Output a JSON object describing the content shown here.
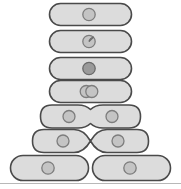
{
  "figure": {
    "background_color": "#ffffff",
    "cell_fill": "#dcdcdc",
    "cell_stroke": "#4a4a4a",
    "nucleoid_fill": "#c4c4c4",
    "nucleoid_stroke": "#7d7d7d",
    "nucleoid_dark_fill": "#9a9a9a",
    "divider_color": "#b8b8b8",
    "stage_count": 7
  },
  "stages": [
    {
      "index": 1,
      "label": "Single cell with one circular chromosome",
      "cell_count": 1,
      "nucleoid_count": 1,
      "nucleoid_state": "single",
      "constriction": "none",
      "cell_width": 82,
      "cell_height": 22,
      "y_center": 14
    },
    {
      "index": 2,
      "label": "Chromosome begins replication, replication fork visible",
      "cell_count": 1,
      "nucleoid_count": 1,
      "nucleoid_state": "replicating",
      "constriction": "none",
      "cell_width": 82,
      "cell_height": 22,
      "y_center": 41
    },
    {
      "index": 3,
      "label": "Chromosome fully replicated",
      "cell_count": 1,
      "nucleoid_count": 1,
      "nucleoid_state": "replicated-dark",
      "constriction": "none",
      "cell_width": 82,
      "cell_height": 22,
      "y_center": 68
    },
    {
      "index": 4,
      "label": "Two overlapping chromosomes begin to separate",
      "cell_count": 1,
      "nucleoid_count": 2,
      "nucleoid_state": "overlapping-pair",
      "constriction": "none",
      "cell_width": 82,
      "cell_height": 22,
      "y_center": 91
    },
    {
      "index": 5,
      "label": "Cell elongates, chromosomes move apart, slight constriction",
      "cell_count": 1,
      "nucleoid_count": 2,
      "nucleoid_state": "separated-pair",
      "constriction": "slight",
      "cell_width": 100,
      "cell_height": 23,
      "y_center": 116
    },
    {
      "index": 6,
      "label": "Septum forms, deep constriction nearly pinches cell in two",
      "cell_count": 1,
      "nucleoid_count": 2,
      "nucleoid_state": "separated-pair",
      "constriction": "deep",
      "cell_width": 116,
      "cell_height": 25,
      "y_center": 141
    },
    {
      "index": 7,
      "label": "Two identical daughter cells separate",
      "cell_count": 2,
      "nucleoid_count": 2,
      "nucleoid_state": "single-each",
      "constriction": "complete",
      "cell_width": 78,
      "cell_height": 25,
      "y_center": 168
    }
  ],
  "divider": {
    "label": "bottom horizontal rule",
    "y": 183
  }
}
